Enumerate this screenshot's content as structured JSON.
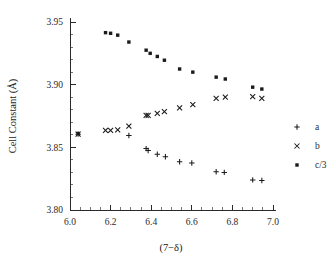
{
  "chart_data": {
    "type": "scatter",
    "title": "",
    "xlabel": "(7−δ)",
    "ylabel": "Cell Constant (Å)",
    "xlim": [
      6.0,
      7.0
    ],
    "ylim": [
      3.8,
      3.95
    ],
    "xticks": [
      "6.0",
      "6.2",
      "6.4",
      "6.6",
      "6.8",
      "7.0"
    ],
    "xtick_values": [
      6.0,
      6.2,
      6.4,
      6.6,
      6.8,
      7.0
    ],
    "xminor_step": 0.05,
    "yticks": [
      "3.80",
      "3.85",
      "3.90",
      "3.95"
    ],
    "ytick_values": [
      3.8,
      3.85,
      3.9,
      3.95
    ],
    "yminor_step": 0.01,
    "grid": false,
    "legend_position": "right",
    "series": [
      {
        "name": "a",
        "marker": "plus",
        "x": [
          6.04,
          6.29,
          6.375,
          6.385,
          6.43,
          6.47,
          6.54,
          6.6,
          6.72,
          6.76,
          6.9,
          6.945
        ],
        "y": [
          3.8605,
          3.8595,
          3.849,
          3.8475,
          3.8445,
          3.8425,
          3.8385,
          3.8375,
          3.8305,
          3.83,
          3.824,
          3.8235
        ]
      },
      {
        "name": "b",
        "marker": "cross",
        "x": [
          6.04,
          6.175,
          6.2,
          6.235,
          6.29,
          6.375,
          6.385,
          6.43,
          6.465,
          6.54,
          6.605,
          6.72,
          6.765,
          6.9,
          6.945
        ],
        "y": [
          3.8605,
          3.8635,
          3.8635,
          3.864,
          3.867,
          3.8755,
          3.8755,
          3.877,
          3.8785,
          3.8815,
          3.884,
          3.889,
          3.89,
          3.8905,
          3.889
        ]
      },
      {
        "name": "c/3",
        "marker": "square",
        "x": [
          6.04,
          6.175,
          6.2,
          6.235,
          6.29,
          6.375,
          6.395,
          6.43,
          6.465,
          6.54,
          6.605,
          6.72,
          6.765,
          6.9,
          6.945
        ],
        "y": [
          3.861,
          3.9415,
          3.941,
          3.9395,
          3.934,
          3.9275,
          3.925,
          3.9225,
          3.9195,
          3.9125,
          3.91,
          3.906,
          3.9045,
          3.898,
          3.8965
        ]
      }
    ],
    "legend": [
      {
        "label": "a",
        "marker": "plus"
      },
      {
        "label": "b",
        "marker": "cross"
      },
      {
        "label": "c/3",
        "marker": "square"
      }
    ],
    "colors": {
      "marker": "#1a1a1a",
      "axis": "#2a2a2a",
      "background": "#ffffff"
    }
  }
}
